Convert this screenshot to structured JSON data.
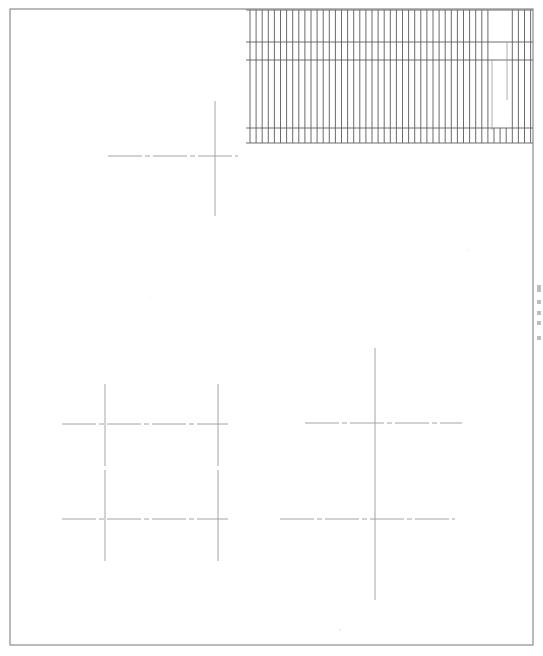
{
  "document": {
    "kind": "technical-drawing",
    "title": "Scanned CAD drawing sheet",
    "sheet_width": 543,
    "sheet_height": 656,
    "background_color": "#ffffff",
    "line_color": "#6e6e6e",
    "border_color": "#8c8c8c",
    "centerline_color": "#9a9a9a",
    "hatch_color": "#5a5a5a"
  },
  "border": {
    "name": "sheet-border",
    "x": 10,
    "y": 9,
    "width": 523,
    "height": 636,
    "stroke_width": 1.2
  },
  "hatch_panel": {
    "name": "hatched-panel",
    "x": 246,
    "y": 9,
    "width": 287,
    "height": 135,
    "vertical_line_count": 47,
    "vertical_spacing": 6.1,
    "vertical_stroke_width": 0.9,
    "horizontal_rules": [
      10,
      42,
      60,
      128,
      143
    ],
    "gap_start_x": 492,
    "gap_end_x": 508,
    "short_tick_lines": [
      {
        "x": 507,
        "y1": 42,
        "y2": 100
      },
      {
        "x": 492,
        "y1": 60,
        "y2": 130
      }
    ]
  },
  "centerline_style": {
    "dash_pattern": "34 3 5 3",
    "stroke_width": 0.9
  },
  "crosshairs": [
    {
      "name": "crosshair-upper-left",
      "center_x": 215,
      "center_y": 156,
      "h_x1": 108,
      "h_x2": 238,
      "v_y1": 101,
      "v_y2": 216
    },
    {
      "name": "crosshair-lower-left-top",
      "center_x": 105,
      "center_y": 424,
      "h_x1": 62,
      "h_x2": 228,
      "v_y1": 384,
      "v_y2": 466
    },
    {
      "name": "crosshair-lower-left-bottom",
      "center_x": 105,
      "center_y": 519,
      "h_x1": 62,
      "h_x2": 228,
      "v_y1": 470,
      "v_y2": 561
    },
    {
      "name": "crosshair-lower-left-right-top",
      "center_x": 218,
      "center_y": 424,
      "h_x1": 62,
      "h_x2": 228,
      "v_y1": 384,
      "v_y2": 466
    },
    {
      "name": "crosshair-lower-left-right-bottom",
      "center_x": 218,
      "center_y": 519,
      "h_x1": 62,
      "h_x2": 228,
      "v_y1": 470,
      "v_y2": 561
    },
    {
      "name": "crosshair-lower-right-top",
      "center_x": 375,
      "center_y": 423,
      "h_x1": 305,
      "h_x2": 462,
      "v_y1": 348,
      "v_y2": 600
    },
    {
      "name": "crosshair-lower-right-bottom",
      "center_x": 375,
      "center_y": 519,
      "h_x1": 280,
      "h_x2": 455,
      "v_y1": 348,
      "v_y2": 600
    }
  ],
  "edge_marks": {
    "name": "right-edge-annotation-marks",
    "x": 537,
    "marks": [
      {
        "y": 285,
        "width": 4,
        "height": 7
      },
      {
        "y": 300,
        "width": 4,
        "height": 4
      },
      {
        "y": 311,
        "width": 4,
        "height": 4
      },
      {
        "y": 321,
        "width": 4,
        "height": 4
      },
      {
        "y": 336,
        "width": 4,
        "height": 4
      }
    ],
    "color": "#bdbdbd"
  },
  "scan_artifacts": {
    "name": "scan-speckles",
    "speckles": [
      {
        "x": 340,
        "y": 630,
        "r": 0.8
      },
      {
        "x": 150,
        "y": 296,
        "r": 0.6
      },
      {
        "x": 468,
        "y": 250,
        "r": 0.6
      }
    ],
    "color": "#d8d8d8"
  }
}
